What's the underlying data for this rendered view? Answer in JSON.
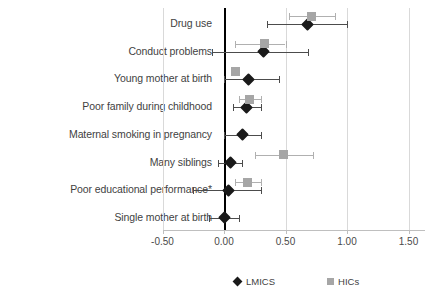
{
  "chart_data": {
    "type": "scatter",
    "chart_kind": "forest-plot",
    "title": "",
    "xlabel": "",
    "ylabel": "",
    "xlim": [
      -0.5,
      1.5
    ],
    "xticks": [
      -0.5,
      0.0,
      0.5,
      1.0,
      1.5
    ],
    "xtick_labels": [
      "-0.50",
      "0.00",
      "0.50",
      "1.00",
      "1.50"
    ],
    "grid": true,
    "reference_line": 0.0,
    "legend_position": "bottom",
    "categories": [
      "Drug use",
      "Conduct problems",
      "Young mother at birth",
      "Poor family during childhood",
      "Maternal smoking in pregnancy",
      "Many siblings",
      "Poor educational performance*",
      "Single mother at birth"
    ],
    "series": [
      {
        "name": "LMICS",
        "marker": "diamond",
        "color": "#1a1a1a",
        "values": [
          0.68,
          0.32,
          0.2,
          0.18,
          0.15,
          0.05,
          0.04,
          0.0
        ],
        "ci_low": [
          0.35,
          -0.1,
          0.0,
          0.07,
          0.0,
          -0.05,
          -0.25,
          -0.12
        ],
        "ci_high": [
          1.0,
          0.68,
          0.45,
          0.3,
          0.3,
          0.15,
          0.3,
          0.12
        ]
      },
      {
        "name": "HICs",
        "marker": "square",
        "color": "#a6a6a6",
        "values": [
          0.71,
          0.33,
          0.09,
          0.21,
          null,
          0.48,
          0.19,
          null
        ],
        "ci_low": [
          0.53,
          0.09,
          null,
          0.12,
          null,
          0.25,
          0.09,
          null
        ],
        "ci_high": [
          0.9,
          0.5,
          null,
          0.3,
          null,
          0.72,
          0.3,
          null
        ]
      }
    ]
  },
  "legend": {
    "entries": [
      {
        "label": "LMICS",
        "marker": "diamond"
      },
      {
        "label": "HICs",
        "marker": "square"
      }
    ]
  }
}
